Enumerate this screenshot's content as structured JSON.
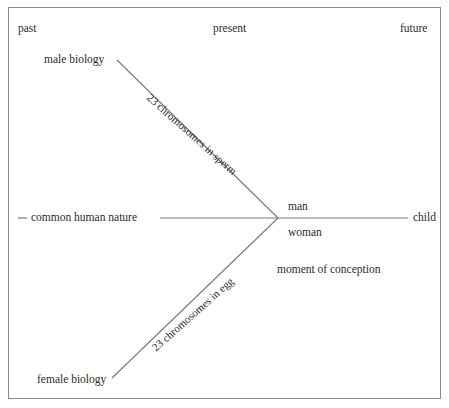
{
  "diagram": {
    "title_labels": {
      "past": "past",
      "present": "present",
      "future": "future"
    },
    "nodes": {
      "male_biology": "male biology",
      "female_biology": "female biology",
      "common_human_nature": "common human nature",
      "man": "man",
      "woman": "woman",
      "child": "child",
      "moment_of_conception": "moment of conception"
    },
    "edge_labels": {
      "sperm": "23 chromosomes in sperm",
      "egg": "23 chromosomes in egg"
    },
    "colors": {
      "line": "#7d7d7d",
      "frame": "#8a8a8a",
      "text": "#2b2b2b",
      "background": "#ffffff"
    }
  }
}
